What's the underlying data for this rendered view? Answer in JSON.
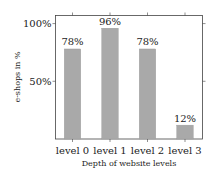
{
  "chart_data": {
    "type": "bar",
    "title": "",
    "xlabel": "Depth of website levels",
    "ylabel": "e-shops in %",
    "categories": [
      "level 0",
      "level 1",
      "level 2",
      "level 3"
    ],
    "values": [
      78,
      96,
      78,
      12
    ],
    "data_labels": [
      "78%",
      "96%",
      "78%",
      "12%"
    ],
    "ylim": [
      0,
      107
    ],
    "yticks": [
      50,
      100
    ],
    "ytick_labels": [
      "50%",
      "100%"
    ],
    "bar_color": "#a9a9a9",
    "grid": false,
    "legend": "none"
  }
}
